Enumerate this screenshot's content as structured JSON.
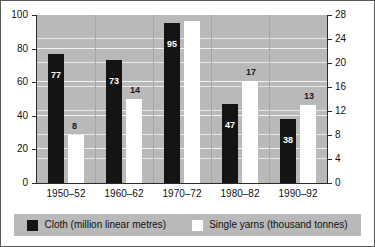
{
  "chart_data": {
    "type": "bar",
    "title": "",
    "xlabel": "",
    "grid": true,
    "legend_position": "bottom",
    "categories": [
      "1950–52",
      "1960–62",
      "1970–72",
      "1980–82",
      "1990–92"
    ],
    "series": [
      {
        "name": "Cloth (million linear metres)",
        "axis": "left",
        "color": "#141414",
        "values": [
          77,
          73,
          95,
          47,
          38
        ]
      },
      {
        "name": "Single yarns (thousand tonnes)",
        "axis": "right",
        "color": "#ffffff",
        "values": [
          8,
          14,
          27,
          17,
          13
        ]
      }
    ],
    "axes": {
      "left": {
        "label": "",
        "ylim": [
          0,
          100
        ],
        "ticks": [
          0,
          20,
          40,
          60,
          80,
          100
        ],
        "tick_labels": [
          "0",
          "20",
          "40",
          "60",
          "80",
          "100"
        ]
      },
      "right": {
        "label": "",
        "ylim": [
          0,
          28
        ],
        "ticks": [
          0,
          4,
          8,
          12,
          16,
          20,
          24,
          28
        ],
        "tick_labels": [
          "0",
          "4",
          "8",
          "12",
          "16",
          "20",
          "24",
          "28"
        ]
      }
    },
    "data_labels": {
      "cloth": [
        "77",
        "73",
        "95",
        "47",
        "38"
      ],
      "yarn": [
        "8",
        "14",
        "27",
        "17",
        "13"
      ]
    }
  },
  "legend": {
    "entries": [
      {
        "label": "Cloth (million linear metres)",
        "swatch": "black-square-icon"
      },
      {
        "label": "Single yarns (thousand tonnes)",
        "swatch": "white-square-icon"
      }
    ]
  },
  "colors": {
    "plot_background": "#b9b9b9",
    "cloth_bar": "#141414",
    "yarn_bar": "#ffffff",
    "axis_line": "#2b2b2b",
    "gridline": "#eeeeee",
    "text": "#111111"
  }
}
